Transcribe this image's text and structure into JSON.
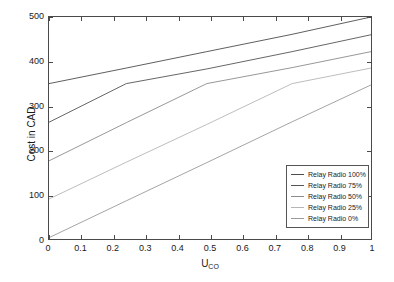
{
  "chart_data": {
    "type": "line",
    "title": "",
    "xlabel": "U_CO",
    "xlabel_base": "U",
    "xlabel_sub": "CO",
    "ylabel": "Cost in CAD",
    "xlim": [
      0,
      1
    ],
    "ylim": [
      0,
      500
    ],
    "grid": false,
    "legend_position": "lower right",
    "xticks": [
      0,
      0.1,
      0.2,
      0.3,
      0.4,
      0.5,
      0.6,
      0.7,
      0.8,
      0.9,
      1
    ],
    "xticklabels": [
      "0",
      "0.1",
      "0.2",
      "0.3",
      "0.4",
      "0.5",
      "0.6",
      "0.7",
      "0.8",
      "0.9",
      "1"
    ],
    "yticks": [
      0,
      100,
      200,
      300,
      400,
      500
    ],
    "yticklabels": [
      "0",
      "100",
      "200",
      "300",
      "400",
      "500"
    ],
    "series": [
      {
        "name": "Relay Radio 100%",
        "color": "#4d4d4d",
        "x": [
          0,
          0.24,
          0.49,
          0.755,
          1
        ],
        "y": [
          350,
          385,
          422,
          461,
          500
        ]
      },
      {
        "name": "Relay Radio 75%",
        "color": "#555555",
        "x": [
          0,
          0.24,
          0.49,
          0.755,
          1
        ],
        "y": [
          263,
          350,
          383,
          422,
          460
        ]
      },
      {
        "name": "Relay Radio 50%",
        "color": "#8c8c8c",
        "x": [
          0,
          0.24,
          0.49,
          0.755,
          1
        ],
        "y": [
          176,
          262,
          350,
          386,
          422
        ]
      },
      {
        "name": "Relay Radio 25%",
        "color": "#b5b5b5",
        "x": [
          0,
          0.24,
          0.49,
          0.755,
          1
        ],
        "y": [
          90,
          173,
          258,
          350,
          385
        ]
      },
      {
        "name": "Relay Radio 0%",
        "color": "#9a9a9a",
        "x": [
          0,
          0.24,
          0.49,
          0.755,
          1
        ],
        "y": [
          3,
          86,
          172,
          264,
          347
        ]
      }
    ]
  },
  "axes": {
    "y_title": "Cost in CAD",
    "x_title_base": "U",
    "x_title_sub": "CO"
  },
  "legend": {
    "items": [
      {
        "label": "Relay Radio 100%",
        "color": "#4d4d4d"
      },
      {
        "label": "Relay Radio 75%",
        "color": "#555555"
      },
      {
        "label": "Relay Radio 50%",
        "color": "#8c8c8c"
      },
      {
        "label": "Relay Radio 25%",
        "color": "#b5b5b5"
      },
      {
        "label": "Relay Radio 0%",
        "color": "#9a9a9a"
      }
    ]
  }
}
